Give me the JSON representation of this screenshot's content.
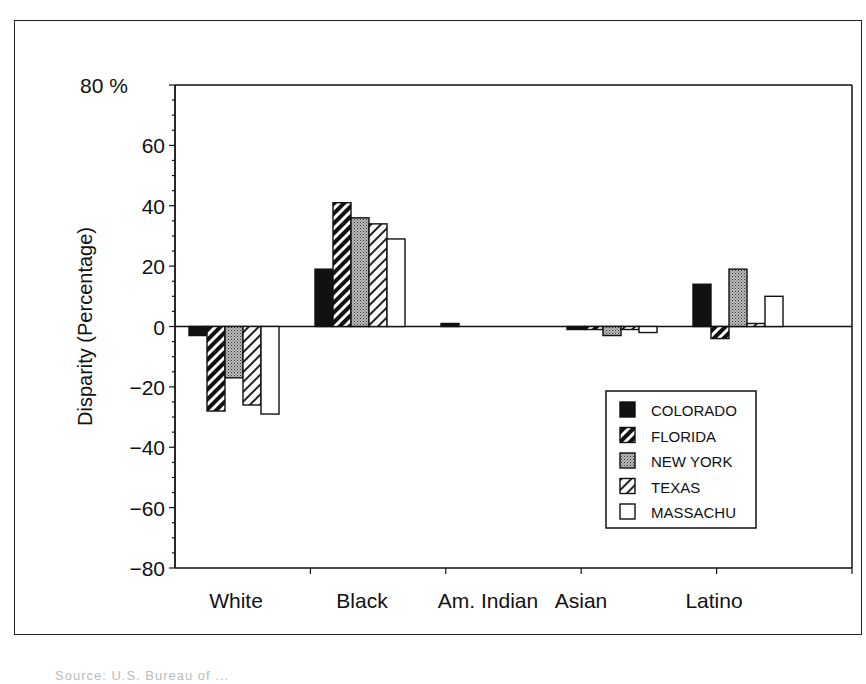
{
  "chart_data": {
    "type": "bar",
    "title": "",
    "xlabel": "",
    "ylabel": "Disparity (Percentage)",
    "ylim": [
      -80,
      80
    ],
    "yticks": [
      80,
      60,
      40,
      20,
      0,
      -20,
      -40,
      -60,
      -80
    ],
    "ytick_labels": [
      "80 %",
      "60",
      "40",
      "20",
      "0",
      "−20",
      "−40",
      "−60",
      "−80"
    ],
    "grid": false,
    "legend_position": "lower right inside",
    "categories": [
      "White",
      "Black",
      "Am. Indian",
      "Asian",
      "Latino"
    ],
    "series": [
      {
        "name": "COLORADO",
        "pattern": "solid-black",
        "values": [
          -3,
          19,
          1,
          -1,
          14
        ]
      },
      {
        "name": "FLORIDA",
        "pattern": "dark-diagonal-hatch",
        "values": [
          -28,
          41,
          0,
          -1,
          -4
        ]
      },
      {
        "name": "NEW YORK",
        "pattern": "gray-crosshatch",
        "values": [
          -17,
          36,
          0,
          -3,
          19
        ]
      },
      {
        "name": "TEXAS",
        "pattern": "light-diagonal-hatch",
        "values": [
          -26,
          34,
          0,
          -1,
          1
        ]
      },
      {
        "name": "MASSACHU",
        "pattern": "white",
        "values": [
          -29,
          29,
          0,
          -2,
          10
        ]
      }
    ]
  },
  "footer": {
    "source_text": "Source: U.S. Bureau of ..."
  }
}
